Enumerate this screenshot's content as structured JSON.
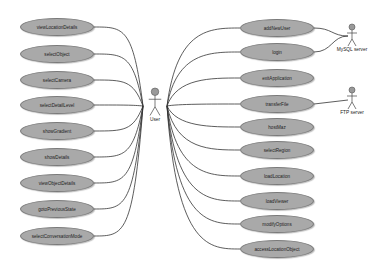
{
  "diagram": {
    "type": "UML use case diagram",
    "actors": [
      {
        "id": "user",
        "label": "User",
        "x": 155,
        "y": 108
      },
      {
        "id": "mysql",
        "label": "MySQL server",
        "x": 352,
        "y": 40
      },
      {
        "id": "ftp",
        "label": "FTP server",
        "x": 352,
        "y": 103
      }
    ],
    "left_use_cases": [
      {
        "label": "viewLocationDetails",
        "y": 27
      },
      {
        "label": "selectObject",
        "y": 54
      },
      {
        "label": "selectCamera",
        "y": 80
      },
      {
        "label": "selectDetailLevel",
        "y": 105
      },
      {
        "label": "showGradient",
        "y": 131
      },
      {
        "label": "showDetails",
        "y": 157
      },
      {
        "label": "viewObjectDetails",
        "y": 183
      },
      {
        "label": "gotoPreviousState",
        "y": 209
      },
      {
        "label": "selectConversationMode",
        "y": 236
      }
    ],
    "right_use_cases": [
      {
        "label": "addNewUser",
        "y": 28
      },
      {
        "label": "login",
        "y": 52
      },
      {
        "label": "exitApplication",
        "y": 78
      },
      {
        "label": "transferFile",
        "y": 104
      },
      {
        "label": "hostMaz",
        "y": 127
      },
      {
        "label": "selectRegion",
        "y": 150
      },
      {
        "label": "loadLocation",
        "y": 176
      },
      {
        "label": "loadViewer",
        "y": 201
      },
      {
        "label": "modifyOptions",
        "y": 224
      },
      {
        "label": "accessLocationObject",
        "y": 249
      }
    ],
    "colors": {
      "ellipse_fill": "#a9a9a9",
      "ellipse_border": "#7a7a7a",
      "line": "#333333",
      "actor_head": "#999999"
    }
  }
}
